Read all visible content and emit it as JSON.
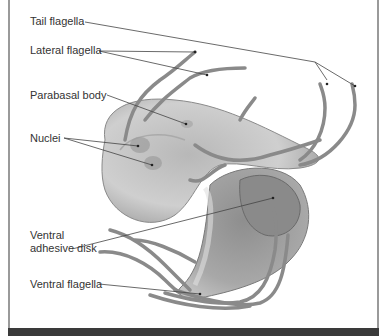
{
  "diagram": {
    "labels": [
      {
        "id": "tail-flagella",
        "text": "Tail flagella"
      },
      {
        "id": "lateral-flagella",
        "text": "Lateral flagella"
      },
      {
        "id": "parabasal-body",
        "text": "Parabasal body"
      },
      {
        "id": "nuclei",
        "text": "Nuclei"
      },
      {
        "id": "ventral-adhesive-disk",
        "text": "Ventral adhesive disk",
        "lines": [
          "Ventral",
          "adhesive disk"
        ]
      },
      {
        "id": "ventral-flagella",
        "text": "Ventral flagella"
      }
    ]
  },
  "colors": {
    "frame_border": "#9a9a9a",
    "bottom_bar": "#3a3a3a",
    "label_text": "#333333",
    "leader_line": "#444444",
    "cell_fill": "#c8c8c8",
    "flagella": "#8a8a8a"
  }
}
